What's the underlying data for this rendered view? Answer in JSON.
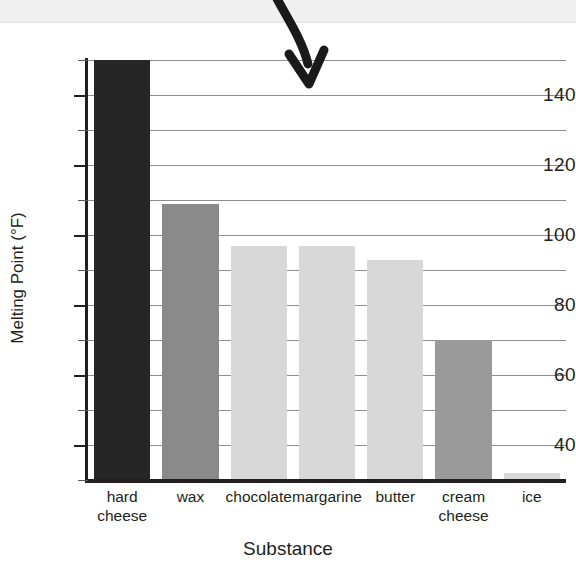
{
  "chart_data": {
    "type": "bar",
    "title": "",
    "xlabel": "Substance",
    "ylabel": "Melting Point (°F)",
    "categories": [
      "hard cheese",
      "wax",
      "chocolate",
      "margarine",
      "butter",
      "cream cheese",
      "ice"
    ],
    "values": [
      150,
      109,
      97,
      97,
      93,
      70,
      32
    ],
    "value_notes": {
      "hard cheese": "bar is clipped at the top of the plot area (≥150)",
      "ice": "no visible bar; value falls at or below the axis baseline"
    },
    "ylim": [
      30,
      150
    ],
    "ytick_labels": [
      "40",
      "60",
      "80",
      "100",
      "120",
      "140"
    ],
    "ytick_values": [
      40,
      60,
      80,
      100,
      120,
      140
    ],
    "yminor_values": [
      30,
      50,
      70,
      90,
      110,
      130,
      150
    ],
    "grid": "horizontal",
    "legend": "none",
    "bar_colors": [
      "#262626",
      "#8a8a8a",
      "#d8d8d8",
      "#d8d8d8",
      "#d8d8d8",
      "#9a9a9a",
      "#d8d8d8"
    ],
    "annotations": [
      {
        "name": "curved-down-arrow",
        "target": "top of hard cheese / chocolate region",
        "color": "#1a1a1a"
      }
    ]
  },
  "axis": {
    "gridline_color": "#8e8e8e",
    "spine_color": "#231f20"
  },
  "categories_display": [
    [
      "hard",
      "cheese"
    ],
    [
      "wax",
      ""
    ],
    [
      "chocolate",
      ""
    ],
    [
      "margarine",
      ""
    ],
    [
      "butter",
      ""
    ],
    [
      "cream",
      "cheese"
    ],
    [
      "ice",
      ""
    ]
  ]
}
